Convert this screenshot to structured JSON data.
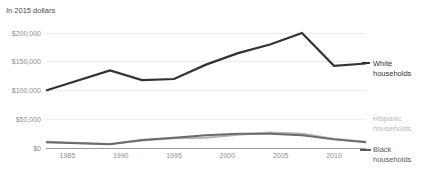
{
  "subtitle": "In 2015 dollars",
  "chart_data": {
    "type": "line",
    "title": "",
    "subtitle": "In 2015 dollars",
    "xlabel": "",
    "ylabel": "",
    "xlim": [
      1983,
      2013
    ],
    "ylim": [
      0,
      200000
    ],
    "grid": true,
    "legend_position": "right",
    "y_ticks": [
      0,
      50000,
      100000,
      150000,
      200000
    ],
    "y_tick_labels": [
      "$0",
      "$50,000",
      "$100,000",
      "$150,000",
      "$200,000"
    ],
    "x_ticks": [
      1985,
      1990,
      1995,
      2000,
      2005,
      2010
    ],
    "x_tick_labels": [
      "1985",
      "1990",
      "1995",
      "2000",
      "2005",
      "2010"
    ],
    "x": [
      1983,
      1989,
      1992,
      1995,
      1998,
      2001,
      2004,
      2007,
      2010,
      2013
    ],
    "series": [
      {
        "name": "White households",
        "label": "White households",
        "color": "#333333",
        "width": 2.2,
        "values": [
          100000,
          135000,
          118000,
          120000,
          145000,
          165000,
          180000,
          200000,
          143000,
          147000
        ]
      },
      {
        "name": "Hispanic households",
        "label": "Hispanic households",
        "color": "#b4b4b4",
        "width": 2.0,
        "values": [
          11000,
          7000,
          13000,
          17000,
          18000,
          23000,
          27000,
          25000,
          16000,
          11000
        ]
      },
      {
        "name": "Black households",
        "label": "Black households",
        "color": "#6b6b6b",
        "width": 2.0,
        "values": [
          10000,
          6500,
          14000,
          18000,
          22000,
          25000,
          25000,
          22000,
          15000,
          10000
        ]
      }
    ]
  },
  "legend": {
    "white": {
      "label_line1": "White",
      "label_line2": "households",
      "color": "#333333"
    },
    "hispanic": {
      "label_line1": "Hispanic",
      "label_line2": "households",
      "color": "#b8b8b8"
    },
    "black": {
      "label_line1": "Black",
      "label_line2": "households",
      "color": "#5a5a5a"
    }
  }
}
